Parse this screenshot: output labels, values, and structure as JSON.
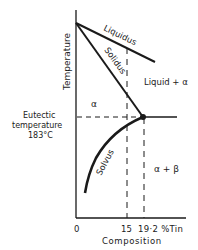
{
  "diagram": {
    "axes": {
      "y_label": "Temperature",
      "x_label": "Composition",
      "x_ticks": [
        "0",
        "15",
        "19·2 %Tin"
      ]
    },
    "lines": {
      "liquidus": "Liquidus",
      "solidus": "Solidus",
      "solvus": "Solvus"
    },
    "regions": {
      "alpha": "α",
      "liquid_alpha": "Liquid + α",
      "alpha_beta": "α + β"
    },
    "eutectic": {
      "line1": "Eutectic",
      "line2": "temperature",
      "line3": "183°C"
    }
  }
}
